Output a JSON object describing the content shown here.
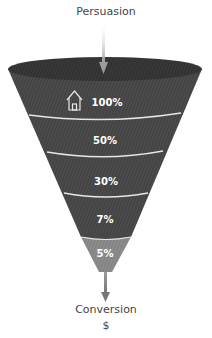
{
  "diagram": {
    "type": "conversion-funnel",
    "top_label": "Persuasion",
    "bottom_label": "Conversion",
    "bottom_sublabel": "$",
    "stages": [
      {
        "label": "100%",
        "icon": "house-icon"
      },
      {
        "label": "50%"
      },
      {
        "label": "30%"
      },
      {
        "label": "7%"
      },
      {
        "label": "5%"
      }
    ],
    "colors": {
      "funnel_body": "#4b4b4b",
      "funnel_top": "#363636",
      "funnel_tip": "#8a8a8a",
      "divider": "#e6e6e6",
      "arrow": "#a8a8a8",
      "text": "#444444",
      "stage_text": "#ffffff"
    }
  }
}
